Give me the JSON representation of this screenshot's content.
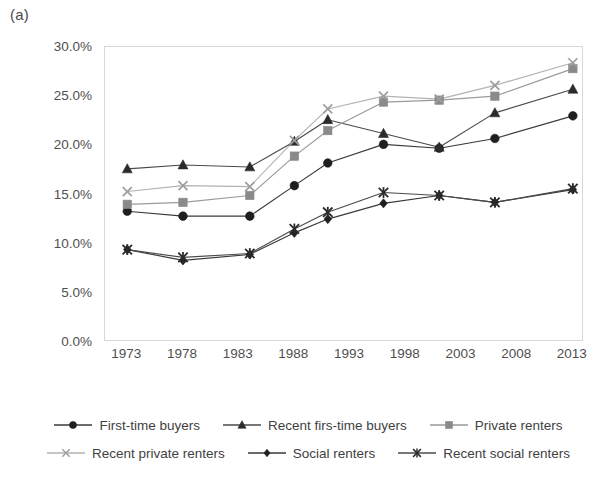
{
  "figure": {
    "panel_label": "(a)"
  },
  "chart_data": {
    "type": "line",
    "title": "",
    "xlabel": "",
    "ylabel": "",
    "xlim": [
      1971,
      2014
    ],
    "ylim": [
      0,
      30
    ],
    "grid": false,
    "legend_position": "bottom",
    "x": [
      1973,
      1978,
      1984,
      1988,
      1991,
      1996,
      2001,
      2006,
      2013
    ],
    "x_tick_labels": [
      "1973",
      "1978",
      "1983",
      "1988",
      "1993",
      "1998",
      "2003",
      "2008",
      "2013"
    ],
    "x_tick_values": [
      1973,
      1978,
      1983,
      1988,
      1993,
      1998,
      2003,
      2008,
      2013
    ],
    "y_tick_labels": [
      "0.0%",
      "5.0%",
      "10.0%",
      "15.0%",
      "20.0%",
      "25.0%",
      "30.0%"
    ],
    "y_tick_values": [
      0,
      5,
      10,
      15,
      20,
      25,
      30
    ],
    "series": [
      {
        "name": "First-time buyers",
        "marker": "circle",
        "color": "#1f1f1f",
        "line_color": "#3a3a3a",
        "values": [
          13.3,
          12.8,
          12.8,
          15.9,
          18.2,
          20.1,
          19.7,
          20.7,
          23.0
        ]
      },
      {
        "name": "Recent firs-time buyers",
        "marker": "triangle",
        "color": "#2b2b2b",
        "line_color": "#4a4a4a",
        "values": [
          17.6,
          18.0,
          17.8,
          20.4,
          22.6,
          21.2,
          19.8,
          23.3,
          25.7
        ]
      },
      {
        "name": "Private renters",
        "marker": "square",
        "color": "#8a8a8a",
        "line_color": "#9a9a9a",
        "values": [
          14.0,
          14.2,
          14.9,
          18.9,
          21.5,
          24.4,
          24.6,
          25.0,
          27.8
        ]
      },
      {
        "name": "Recent private renters",
        "marker": "x",
        "color": "#9e9e9e",
        "line_color": "#b2b2b2",
        "values": [
          15.3,
          15.9,
          15.8,
          20.5,
          23.7,
          25.0,
          24.7,
          26.1,
          28.4
        ]
      },
      {
        "name": "Social renters",
        "marker": "diamond",
        "color": "#1f1f1f",
        "line_color": "#3a3a3a",
        "values": [
          9.4,
          8.3,
          8.9,
          11.1,
          12.5,
          14.1,
          14.9,
          14.2,
          15.5
        ]
      },
      {
        "name": "Recent social renters",
        "marker": "star",
        "color": "#2b2b2b",
        "line_color": "#4a4a4a",
        "values": [
          9.4,
          8.6,
          9.0,
          11.5,
          13.2,
          15.2,
          14.9,
          14.2,
          15.6
        ]
      }
    ]
  },
  "legend": {
    "rows": [
      [
        "First-time buyers",
        "Recent firs-time buyers",
        "Private renters"
      ],
      [
        "Recent private renters",
        "Social renters",
        "Recent social renters"
      ]
    ]
  }
}
